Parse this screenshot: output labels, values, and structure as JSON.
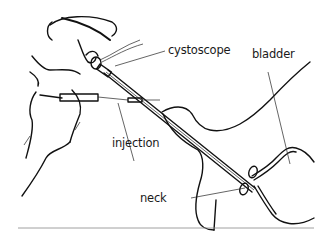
{
  "figure": {
    "labels": {
      "cystoscope": "cystoscope",
      "bladder": "bladder",
      "injection": "injection",
      "neck": "neck"
    },
    "colors": {
      "ink": "#111111",
      "background": "#ffffff",
      "rule": "#888888"
    }
  }
}
